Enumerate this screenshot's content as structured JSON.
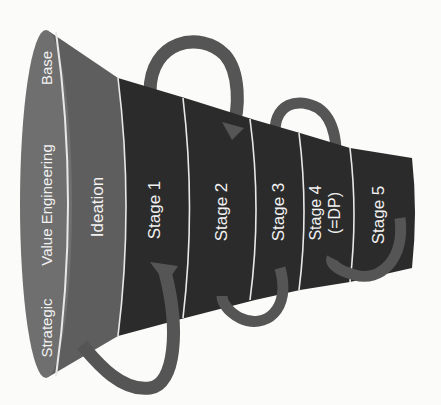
{
  "diagram": {
    "type": "funnel",
    "mouth_labels": {
      "strategic": "Strategic",
      "value_engineering": "Value Engineering",
      "base": "Base"
    },
    "stages": [
      {
        "label": "Ideation"
      },
      {
        "label": "Stage 1"
      },
      {
        "label": "Stage 2"
      },
      {
        "label": "Stage 3"
      },
      {
        "label": "Stage 4",
        "sublabel": "(=DP)"
      },
      {
        "label": "Stage 5"
      }
    ],
    "feedback_loops": [
      {
        "from": "Stage 2",
        "to": "Stage 1",
        "side": "top"
      },
      {
        "from": "Stage 4",
        "to": "Stage 3",
        "side": "top"
      },
      {
        "from": "Stage 1",
        "to": "Ideation",
        "side": "bottom"
      },
      {
        "from": "Stage 3",
        "to": "Stage 2",
        "side": "bottom"
      },
      {
        "from": "Stage 5",
        "to": "Stage 4",
        "side": "bottom"
      }
    ],
    "colors": {
      "background": "#fbfbf9",
      "mouth": "#6f6f6f",
      "ideation": "#5e5e5e",
      "stages": "#2b2b2b",
      "divider": "#e8e8e8",
      "arrows": "#555555",
      "text": "#f2f2f2"
    }
  }
}
